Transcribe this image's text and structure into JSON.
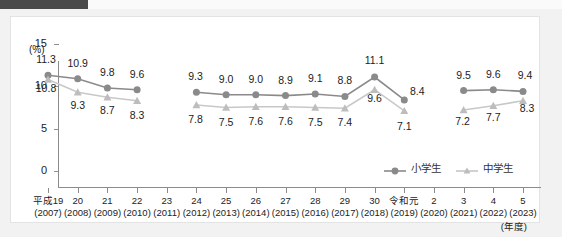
{
  "top_strip": {
    "faint_text": ""
  },
  "chart_data": {
    "type": "line",
    "title": "",
    "xlabel": "(年度)",
    "ylabel": "(%)",
    "ylim": [
      0,
      15
    ],
    "yticks": [
      "0",
      "5",
      "10",
      "15"
    ],
    "grid": false,
    "legend_position": "bottom-right",
    "categories": [
      "平成19",
      "20",
      "21",
      "22",
      "23",
      "24",
      "25",
      "26",
      "27",
      "28",
      "29",
      "30",
      "令和元",
      "2",
      "3",
      "4",
      "5"
    ],
    "categories_western": [
      "(2007)",
      "(2008)",
      "(2009)",
      "(2010)",
      "(2011)",
      "(2012)",
      "(2013)",
      "(2014)",
      "(2015)",
      "(2016)",
      "(2017)",
      "(2018)",
      "(2019)",
      "(2020)",
      "(2021)",
      "(2022)",
      "(2023)"
    ],
    "series": [
      {
        "name": "小学生",
        "marker": "circle",
        "color": "#8a8a8a",
        "values": [
          11.3,
          10.9,
          9.8,
          9.6,
          null,
          9.3,
          9.0,
          9.0,
          8.9,
          9.1,
          8.8,
          11.1,
          8.4,
          null,
          9.5,
          9.6,
          9.4
        ]
      },
      {
        "name": "中学生",
        "marker": "triangle",
        "color": "#bdbdbd",
        "values": [
          10.8,
          9.3,
          8.7,
          8.3,
          null,
          7.8,
          7.5,
          7.6,
          7.6,
          7.5,
          7.4,
          9.6,
          7.1,
          null,
          7.2,
          7.7,
          8.3
        ]
      }
    ],
    "colors": {
      "primary": "#8a8a8a",
      "secondary": "#bdbdbd",
      "axis": "#8c8c8c",
      "text": "#1c1c1c",
      "card_bg": "#ffffff",
      "page_bg": "#f2f2f2"
    }
  }
}
